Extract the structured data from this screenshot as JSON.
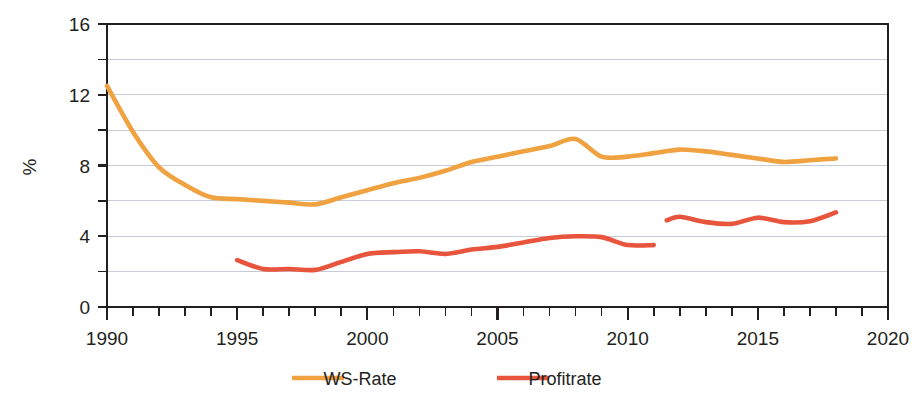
{
  "chart_data": {
    "type": "line",
    "title": "",
    "subtitle": "",
    "xlabel": "",
    "ylabel": "%",
    "xlim": [
      1990,
      2020
    ],
    "ylim": [
      0,
      16
    ],
    "x_ticks_major": [
      1990,
      1995,
      2000,
      2005,
      2010,
      2015,
      2020
    ],
    "x_tick_labels": [
      "1990",
      "1995",
      "2000",
      "2005",
      "2010",
      "2015",
      "2020"
    ],
    "x_tick_step_minor": 1,
    "y_ticks_major": [
      0,
      4,
      8,
      12,
      16
    ],
    "y_tick_labels": [
      "0",
      "4",
      "8",
      "12",
      "16"
    ],
    "y_ticks_minor": [
      2,
      6,
      10,
      14
    ],
    "gridlines": {
      "horizontal": [
        2,
        4,
        6,
        8,
        10,
        12,
        14
      ],
      "vertical": false
    },
    "legend_position": "bottom-center",
    "series": [
      {
        "name": "WS-Rate",
        "color": "#F0A241",
        "x": [
          1990,
          1991,
          1992,
          1993,
          1994,
          1995,
          1996,
          1997,
          1998,
          1999,
          2000,
          2001,
          2002,
          2003,
          2004,
          2005,
          2006,
          2007,
          2008,
          2009,
          2010,
          2011,
          2012,
          2013,
          2014,
          2015,
          2016,
          2017,
          2018
        ],
        "values": [
          12.5,
          9.9,
          7.9,
          6.9,
          6.2,
          6.1,
          6.0,
          5.9,
          5.8,
          6.2,
          6.6,
          7.0,
          7.3,
          7.7,
          8.2,
          8.5,
          8.8,
          9.1,
          9.5,
          8.5,
          8.5,
          8.7,
          8.9,
          8.8,
          8.6,
          8.4,
          8.2,
          8.3,
          8.4
        ]
      },
      {
        "name": "Profitrate",
        "color": "#E8543C",
        "segments": [
          {
            "x": [
              1995,
              1996,
              1997,
              1998,
              1999,
              2000,
              2001,
              2002,
              2003,
              2004,
              2005,
              2006,
              2007,
              2008,
              2009,
              2010,
              2011
            ],
            "values": [
              2.65,
              2.15,
              2.15,
              2.1,
              2.55,
              3.0,
              3.1,
              3.15,
              3.0,
              3.25,
              3.4,
              3.65,
              3.9,
              4.0,
              3.95,
              3.5,
              3.5
            ]
          },
          {
            "x": [
              2011.5,
              2012,
              2013,
              2014,
              2015,
              2016,
              2017,
              2018
            ],
            "values": [
              4.9,
              5.1,
              4.8,
              4.7,
              5.05,
              4.8,
              4.85,
              5.35
            ]
          }
        ]
      }
    ]
  },
  "legend": {
    "items": [
      {
        "label": "WS-Rate",
        "color": "#F0A241"
      },
      {
        "label": "Profitrate",
        "color": "#E8543C"
      }
    ]
  },
  "axes": {
    "y_axis_title": "%"
  }
}
